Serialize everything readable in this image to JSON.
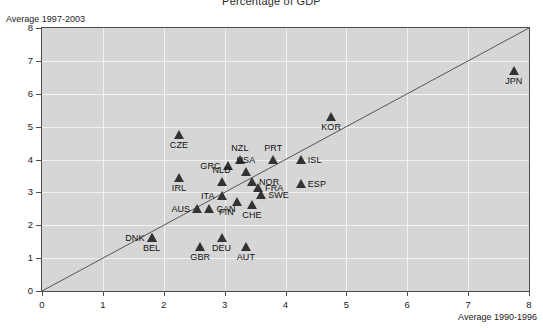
{
  "chart_data": {
    "type": "scatter",
    "title": "Percentage of GDP",
    "xlabel": "Average 1990-1996",
    "ylabel": "Average 1997-2003",
    "xlim": [
      0,
      8
    ],
    "ylim": [
      0,
      8
    ],
    "xticks": [
      0,
      1,
      2,
      3,
      4,
      5,
      6,
      7,
      8
    ],
    "yticks": [
      0,
      1,
      2,
      3,
      4,
      5,
      6,
      7,
      8
    ],
    "grid": true,
    "legend": "none",
    "annotations": [
      {
        "name": "diagonal-reference-line",
        "from": [
          0,
          0
        ],
        "to": [
          8,
          8
        ]
      }
    ],
    "points": [
      {
        "label": "JPN",
        "x": 7.75,
        "y": 6.7,
        "label_pos": "below"
      },
      {
        "label": "KOR",
        "x": 4.75,
        "y": 5.3,
        "label_pos": "below"
      },
      {
        "label": "CZE",
        "x": 2.25,
        "y": 4.75,
        "label_pos": "below"
      },
      {
        "label": "NZL",
        "x": 3.25,
        "y": 4.0,
        "label_pos": "above"
      },
      {
        "label": "PRT",
        "x": 3.8,
        "y": 4.0,
        "label_pos": "above"
      },
      {
        "label": "ISL",
        "x": 4.25,
        "y": 4.0,
        "label_pos": "right"
      },
      {
        "label": "GRC",
        "x": 3.05,
        "y": 3.8,
        "label_pos": "left"
      },
      {
        "label": "USA",
        "x": 3.35,
        "y": 3.62,
        "label_pos": "above"
      },
      {
        "label": "IRL",
        "x": 2.25,
        "y": 3.45,
        "label_pos": "below"
      },
      {
        "label": "NLD",
        "x": 2.95,
        "y": 3.32,
        "label_pos": "above"
      },
      {
        "label": "NOR",
        "x": 3.45,
        "y": 3.32,
        "label_pos": "right"
      },
      {
        "label": "ESP",
        "x": 4.25,
        "y": 3.25,
        "label_pos": "right"
      },
      {
        "label": "FRA",
        "x": 3.55,
        "y": 3.12,
        "label_pos": "right"
      },
      {
        "label": "SWE",
        "x": 3.6,
        "y": 2.92,
        "label_pos": "right"
      },
      {
        "label": "ITA",
        "x": 2.95,
        "y": 2.88,
        "label_pos": "left"
      },
      {
        "label": "FIN",
        "x": 3.2,
        "y": 2.72,
        "label_pos": "below-left"
      },
      {
        "label": "CHE",
        "x": 3.45,
        "y": 2.62,
        "label_pos": "below"
      },
      {
        "label": "AUS",
        "x": 2.55,
        "y": 2.5,
        "label_pos": "left"
      },
      {
        "label": "CAN",
        "x": 2.75,
        "y": 2.5,
        "label_pos": "right"
      },
      {
        "label": "DNK",
        "x": 1.8,
        "y": 1.62,
        "label_pos": "left"
      },
      {
        "label": "BEL",
        "x": 1.8,
        "y": 1.62,
        "label_pos": "below"
      },
      {
        "label": "DEU",
        "x": 2.95,
        "y": 1.6,
        "label_pos": "below"
      },
      {
        "label": "GBR",
        "x": 2.6,
        "y": 1.35,
        "label_pos": "below"
      },
      {
        "label": "AUT",
        "x": 3.35,
        "y": 1.35,
        "label_pos": "below"
      }
    ]
  },
  "colors": {
    "plot_background": "#d6d6d6",
    "gridline": "#f2f2f2",
    "marker": "#333333",
    "axis": "#4d4d4d",
    "page_background": "#ffffff"
  }
}
